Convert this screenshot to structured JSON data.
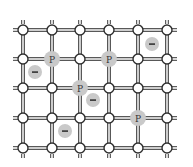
{
  "diagram": {
    "type": "crystal-lattice",
    "title": "",
    "grid": {
      "columns": 6,
      "rows": 5,
      "column_x": [
        23,
        52,
        80,
        109,
        138,
        167
      ],
      "row_y": [
        30,
        59,
        88,
        118,
        148
      ],
      "node_radius": 5,
      "bond_style": "double-line"
    },
    "dopant_atoms": [
      {
        "label": "P",
        "col": 1,
        "row": 1
      },
      {
        "label": "P",
        "col": 3,
        "row": 1
      },
      {
        "label": "P",
        "col": 2,
        "row": 2
      },
      {
        "label": "P",
        "col": 4,
        "row": 3
      }
    ],
    "free_charges": [
      {
        "label": "−",
        "x": 35,
        "y": 72
      },
      {
        "label": "−",
        "x": 152,
        "y": 44
      },
      {
        "label": "−",
        "x": 93,
        "y": 100
      },
      {
        "label": "−",
        "x": 65,
        "y": 131
      }
    ],
    "colors": {
      "highlight": "#c9c9c9",
      "stroke": "#2e2e2e",
      "background": "#ffffff"
    }
  }
}
